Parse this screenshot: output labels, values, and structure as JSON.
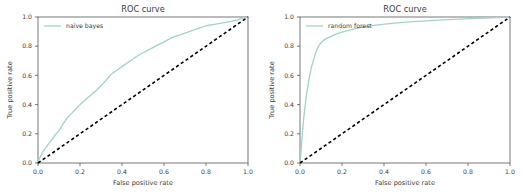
{
  "figure": {
    "background": "#ffffff",
    "panel_count": 2
  },
  "chart_data": [
    {
      "type": "line",
      "title": "ROC curve",
      "xlabel": "False positive rate",
      "ylabel": "True positive rate",
      "xlim": [
        0.0,
        1.0
      ],
      "ylim": [
        0.0,
        1.0
      ],
      "xticks": [
        "0.0",
        "0.2",
        "0.4",
        "0.6",
        "0.8",
        "1.0"
      ],
      "yticks": [
        "0.0",
        "0.2",
        "0.4",
        "0.6",
        "0.8",
        "1.0"
      ],
      "xtick_values": [
        0.0,
        0.2,
        0.4,
        0.6,
        0.8,
        1.0
      ],
      "ytick_values": [
        0.0,
        0.2,
        0.4,
        0.6,
        0.8,
        1.0
      ],
      "grid": false,
      "legend_position": "upper left",
      "legend_entries": [
        "naive bayes"
      ],
      "series": [
        {
          "name": "naive bayes",
          "color": "#9fd3ce",
          "linestyle": "solid",
          "x": [
            0.0,
            0.01,
            0.02,
            0.04,
            0.06,
            0.08,
            0.1,
            0.12,
            0.14,
            0.16,
            0.18,
            0.2,
            0.24,
            0.28,
            0.32,
            0.35,
            0.38,
            0.4,
            0.44,
            0.48,
            0.52,
            0.56,
            0.6,
            0.64,
            0.68,
            0.72,
            0.76,
            0.8,
            0.84,
            0.88,
            0.92,
            0.95,
            0.97,
            1.0
          ],
          "y": [
            0.01,
            0.04,
            0.07,
            0.11,
            0.15,
            0.19,
            0.22,
            0.27,
            0.31,
            0.34,
            0.37,
            0.4,
            0.45,
            0.5,
            0.56,
            0.61,
            0.64,
            0.66,
            0.7,
            0.74,
            0.77,
            0.8,
            0.83,
            0.86,
            0.88,
            0.9,
            0.92,
            0.94,
            0.95,
            0.96,
            0.97,
            0.98,
            0.99,
            1.0
          ]
        },
        {
          "name": "chance",
          "color": "#000000",
          "linestyle": "dashed",
          "x": [
            0.0,
            1.0
          ],
          "y": [
            0.0,
            1.0
          ]
        }
      ]
    },
    {
      "type": "line",
      "title": "ROC curve",
      "xlabel": "False positive rate",
      "ylabel": "True positive rate",
      "xlim": [
        0.0,
        1.0
      ],
      "ylim": [
        0.0,
        1.0
      ],
      "xticks": [
        "0.0",
        "0.2",
        "0.4",
        "0.6",
        "0.8",
        "1.0"
      ],
      "yticks": [
        "0.0",
        "0.2",
        "0.4",
        "0.6",
        "0.8",
        "1.0"
      ],
      "xtick_values": [
        0.0,
        0.2,
        0.4,
        0.6,
        0.8,
        1.0
      ],
      "ytick_values": [
        0.0,
        0.2,
        0.4,
        0.6,
        0.8,
        1.0
      ],
      "grid": false,
      "legend_position": "upper left",
      "legend_entries": [
        "random forest"
      ],
      "series": [
        {
          "name": "random forest",
          "color": "#9fd3ce",
          "linestyle": "solid",
          "x": [
            0.0,
            0.004,
            0.008,
            0.012,
            0.018,
            0.024,
            0.03,
            0.038,
            0.046,
            0.055,
            0.065,
            0.075,
            0.085,
            0.095,
            0.11,
            0.125,
            0.14,
            0.155,
            0.175,
            0.2,
            0.23,
            0.27,
            0.32,
            0.38,
            0.45,
            0.52,
            0.6,
            0.68,
            0.76,
            0.84,
            0.91,
            0.96,
            1.0
          ],
          "y": [
            0.0,
            0.06,
            0.14,
            0.22,
            0.31,
            0.39,
            0.46,
            0.53,
            0.6,
            0.66,
            0.71,
            0.755,
            0.79,
            0.815,
            0.838,
            0.852,
            0.862,
            0.872,
            0.884,
            0.896,
            0.908,
            0.922,
            0.936,
            0.948,
            0.958,
            0.966,
            0.974,
            0.98,
            0.986,
            0.991,
            0.995,
            0.998,
            1.0
          ]
        },
        {
          "name": "chance",
          "color": "#000000",
          "linestyle": "dashed",
          "x": [
            0.0,
            1.0
          ],
          "y": [
            0.0,
            1.0
          ]
        }
      ]
    }
  ]
}
